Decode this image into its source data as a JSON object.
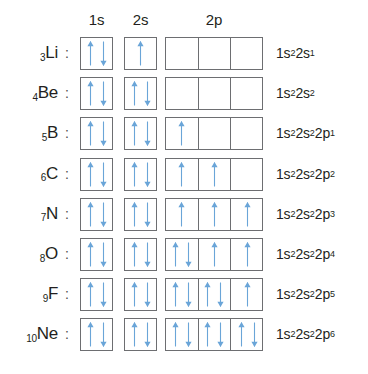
{
  "figure": {
    "colors": {
      "arrow": "#6aa5d8",
      "box_border": "#6d6e71",
      "text": "#231f20",
      "background": "#ffffff"
    },
    "columns": [
      {
        "key": "1s",
        "label": "1s",
        "cells": 1
      },
      {
        "key": "2s",
        "label": "2s",
        "cells": 1
      },
      {
        "key": "2p",
        "label": "2p",
        "cells": 3
      }
    ],
    "separator": ":",
    "icons": {
      "spin_up": "up-arrow-icon",
      "spin_down": "down-arrow-icon"
    }
  },
  "rows": [
    {
      "z": "3",
      "symbol": "Li",
      "orbitals": {
        "1s": [
          "up",
          "down"
        ],
        "2s": [
          "up"
        ],
        "2p": [
          [],
          [],
          []
        ]
      },
      "configuration": {
        "parts": [
          {
            "base": "1s",
            "sup": "2"
          },
          {
            "base": "2s",
            "sup": "1"
          }
        ]
      }
    },
    {
      "z": "4",
      "symbol": "Be",
      "orbitals": {
        "1s": [
          "up",
          "down"
        ],
        "2s": [
          "up",
          "down"
        ],
        "2p": [
          [],
          [],
          []
        ]
      },
      "configuration": {
        "parts": [
          {
            "base": "1s",
            "sup": "2"
          },
          {
            "base": "2s",
            "sup": "2"
          }
        ]
      }
    },
    {
      "z": "5",
      "symbol": "B",
      "orbitals": {
        "1s": [
          "up",
          "down"
        ],
        "2s": [
          "up",
          "down"
        ],
        "2p": [
          [
            "up"
          ],
          [],
          []
        ]
      },
      "configuration": {
        "parts": [
          {
            "base": "1s",
            "sup": "2"
          },
          {
            "base": "2s",
            "sup": "2"
          },
          {
            "base": "2p",
            "sup": "1"
          }
        ]
      }
    },
    {
      "z": "6",
      "symbol": "C",
      "orbitals": {
        "1s": [
          "up",
          "down"
        ],
        "2s": [
          "up",
          "down"
        ],
        "2p": [
          [
            "up"
          ],
          [
            "up"
          ],
          []
        ]
      },
      "configuration": {
        "parts": [
          {
            "base": "1s",
            "sup": "2"
          },
          {
            "base": "2s",
            "sup": "2"
          },
          {
            "base": "2p",
            "sup": "2"
          }
        ]
      }
    },
    {
      "z": "7",
      "symbol": "N",
      "orbitals": {
        "1s": [
          "up",
          "down"
        ],
        "2s": [
          "up",
          "down"
        ],
        "2p": [
          [
            "up"
          ],
          [
            "up"
          ],
          [
            "up"
          ]
        ]
      },
      "configuration": {
        "parts": [
          {
            "base": "1s",
            "sup": "2"
          },
          {
            "base": "2s",
            "sup": "2"
          },
          {
            "base": "2p",
            "sup": "3"
          }
        ]
      }
    },
    {
      "z": "8",
      "symbol": "O",
      "orbitals": {
        "1s": [
          "up",
          "down"
        ],
        "2s": [
          "up",
          "down"
        ],
        "2p": [
          [
            "up",
            "down"
          ],
          [
            "up"
          ],
          [
            "up"
          ]
        ]
      },
      "configuration": {
        "parts": [
          {
            "base": "1s",
            "sup": "2"
          },
          {
            "base": "2s",
            "sup": "2"
          },
          {
            "base": "2p",
            "sup": "4"
          }
        ]
      }
    },
    {
      "z": "9",
      "symbol": "F",
      "orbitals": {
        "1s": [
          "up",
          "down"
        ],
        "2s": [
          "up",
          "down"
        ],
        "2p": [
          [
            "up",
            "down"
          ],
          [
            "up",
            "down"
          ],
          [
            "up"
          ]
        ]
      },
      "configuration": {
        "parts": [
          {
            "base": "1s",
            "sup": "2"
          },
          {
            "base": "2s",
            "sup": "2"
          },
          {
            "base": "2p",
            "sup": "5"
          }
        ]
      }
    },
    {
      "z": "10",
      "symbol": "Ne",
      "orbitals": {
        "1s": [
          "up",
          "down"
        ],
        "2s": [
          "up",
          "down"
        ],
        "2p": [
          [
            "up",
            "down"
          ],
          [
            "up",
            "down"
          ],
          [
            "up",
            "down"
          ]
        ]
      },
      "configuration": {
        "parts": [
          {
            "base": "1s",
            "sup": "2"
          },
          {
            "base": "2s",
            "sup": "2"
          },
          {
            "base": "2p",
            "sup": "6"
          }
        ]
      }
    }
  ]
}
